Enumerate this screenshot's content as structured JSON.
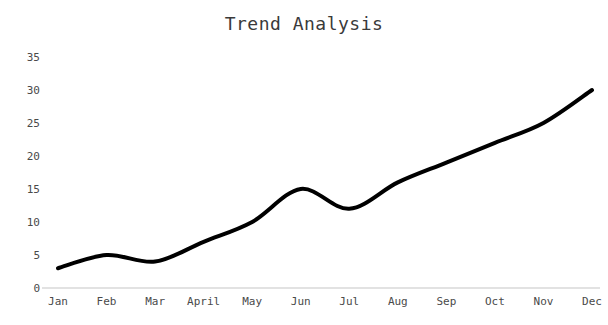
{
  "chart_data": {
    "type": "line",
    "title": "Trend Analysis",
    "xlabel": "",
    "ylabel": "",
    "categories": [
      "Jan",
      "Feb",
      "Mar",
      "April",
      "May",
      "Jun",
      "Jul",
      "Aug",
      "Sep",
      "Oct",
      "Nov",
      "Dec"
    ],
    "values": [
      3,
      5,
      4,
      7,
      10,
      15,
      12,
      16,
      19,
      22,
      25,
      30
    ],
    "series": [
      {
        "name": "Trend",
        "values": [
          3,
          5,
          4,
          7,
          10,
          15,
          12,
          16,
          19,
          22,
          25,
          30
        ]
      }
    ],
    "ylim": [
      0,
      35
    ],
    "yticks": [
      "0",
      "5",
      "10",
      "15",
      "20",
      "25",
      "30",
      "35"
    ],
    "ytick_values": [
      0,
      5,
      10,
      15,
      20,
      25,
      30,
      35
    ],
    "grid": false,
    "legend": false,
    "legend_position": "none",
    "line_color": "#000000",
    "line_width": 4,
    "smooth": true,
    "background_color": "#ffffff",
    "axis_color": "#d8d8d8",
    "tick_label_color": "#4a4a4a",
    "title_color": "#3a3a3a"
  }
}
